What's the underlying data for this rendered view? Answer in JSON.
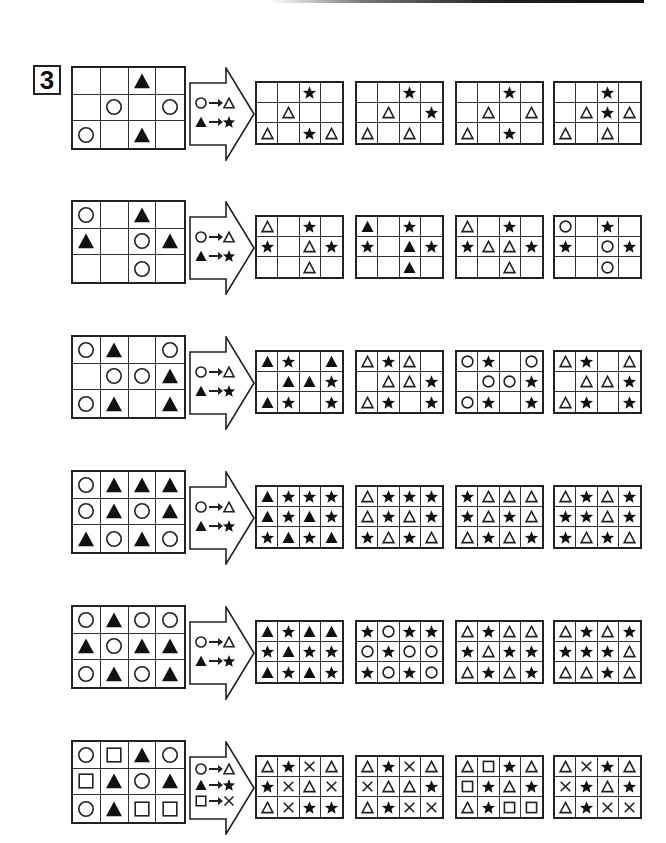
{
  "question_number": "3",
  "shape_key": {
    "circle": "outline circle",
    "tri_fill": "filled triangle",
    "tri_open": "outline triangle",
    "star": "filled star",
    "square": "outline square",
    "cross": "cross"
  },
  "rows": [
    {
      "source": [
        [
          "",
          "",
          "tri_fill",
          ""
        ],
        [
          "",
          "circle",
          "",
          "circle"
        ],
        [
          "circle",
          "",
          "tri_fill",
          ""
        ]
      ],
      "rules": [
        [
          "circle",
          "tri_open"
        ],
        [
          "tri_fill",
          "star"
        ]
      ],
      "options": [
        [
          [
            "",
            "",
            "star",
            ""
          ],
          [
            "",
            "tri_open",
            "",
            ""
          ],
          [
            "tri_open",
            "",
            "star",
            "tri_open"
          ]
        ],
        [
          [
            "",
            "",
            "star",
            ""
          ],
          [
            "",
            "tri_open",
            "",
            "star"
          ],
          [
            "tri_open",
            "",
            "tri_open",
            ""
          ]
        ],
        [
          [
            "",
            "",
            "star",
            ""
          ],
          [
            "",
            "tri_open",
            "",
            "tri_open"
          ],
          [
            "tri_open",
            "",
            "star",
            ""
          ]
        ],
        [
          [
            "",
            "",
            "star",
            ""
          ],
          [
            "",
            "tri_open",
            "star",
            "tri_open"
          ],
          [
            "tri_open",
            "",
            "tri_open",
            ""
          ]
        ]
      ]
    },
    {
      "source": [
        [
          "circle",
          "",
          "tri_fill",
          ""
        ],
        [
          "tri_fill",
          "",
          "circle",
          "tri_fill"
        ],
        [
          "",
          "",
          "circle",
          ""
        ]
      ],
      "rules": [
        [
          "circle",
          "tri_open"
        ],
        [
          "tri_fill",
          "star"
        ]
      ],
      "options": [
        [
          [
            "tri_open",
            "",
            "star",
            ""
          ],
          [
            "star",
            "",
            "tri_open",
            "star"
          ],
          [
            "",
            "",
            "tri_open",
            ""
          ]
        ],
        [
          [
            "tri_fill",
            "",
            "star",
            ""
          ],
          [
            "star",
            "",
            "tri_fill",
            "star"
          ],
          [
            "",
            "",
            "tri_fill",
            ""
          ]
        ],
        [
          [
            "tri_open",
            "",
            "star",
            ""
          ],
          [
            "star",
            "tri_open",
            "tri_open",
            "star"
          ],
          [
            "",
            "",
            "tri_open",
            ""
          ]
        ],
        [
          [
            "circle",
            "",
            "star",
            ""
          ],
          [
            "star",
            "",
            "circle",
            "star"
          ],
          [
            "",
            "",
            "circle",
            ""
          ]
        ]
      ]
    },
    {
      "source": [
        [
          "circle",
          "tri_fill",
          "",
          "circle"
        ],
        [
          "",
          "circle",
          "circle",
          "tri_fill"
        ],
        [
          "circle",
          "tri_fill",
          "",
          "tri_fill"
        ]
      ],
      "rules": [
        [
          "circle",
          "tri_open"
        ],
        [
          "tri_fill",
          "star"
        ]
      ],
      "options": [
        [
          [
            "tri_fill",
            "star",
            "",
            "tri_fill"
          ],
          [
            "",
            "tri_fill",
            "tri_fill",
            "star"
          ],
          [
            "tri_fill",
            "star",
            "",
            "star"
          ]
        ],
        [
          [
            "tri_open",
            "star",
            "tri_open",
            ""
          ],
          [
            "",
            "tri_open",
            "tri_open",
            "star"
          ],
          [
            "tri_open",
            "star",
            "",
            "star"
          ]
        ],
        [
          [
            "circle",
            "star",
            "",
            "circle"
          ],
          [
            "",
            "circle",
            "circle",
            "star"
          ],
          [
            "circle",
            "star",
            "",
            "star"
          ]
        ],
        [
          [
            "tri_open",
            "star",
            "",
            "tri_open"
          ],
          [
            "",
            "tri_open",
            "tri_open",
            "star"
          ],
          [
            "tri_open",
            "star",
            "",
            "star"
          ]
        ]
      ]
    },
    {
      "source": [
        [
          "circle",
          "tri_fill",
          "tri_fill",
          "tri_fill"
        ],
        [
          "circle",
          "tri_fill",
          "circle",
          "tri_fill"
        ],
        [
          "tri_fill",
          "circle",
          "tri_fill",
          "circle"
        ]
      ],
      "rules": [
        [
          "circle",
          "tri_open"
        ],
        [
          "tri_fill",
          "star"
        ]
      ],
      "options": [
        [
          [
            "tri_fill",
            "star",
            "star",
            "star"
          ],
          [
            "tri_fill",
            "star",
            "tri_fill",
            "star"
          ],
          [
            "star",
            "tri_fill",
            "star",
            "tri_fill"
          ]
        ],
        [
          [
            "tri_open",
            "star",
            "star",
            "star"
          ],
          [
            "tri_open",
            "star",
            "tri_open",
            "star"
          ],
          [
            "star",
            "tri_open",
            "star",
            "tri_open"
          ]
        ],
        [
          [
            "star",
            "tri_open",
            "tri_open",
            "tri_open"
          ],
          [
            "star",
            "tri_open",
            "star",
            "tri_open"
          ],
          [
            "tri_open",
            "star",
            "tri_open",
            "star"
          ]
        ],
        [
          [
            "tri_open",
            "star",
            "tri_open",
            "star"
          ],
          [
            "star",
            "star",
            "tri_open",
            "star"
          ],
          [
            "star",
            "tri_open",
            "star",
            "tri_open"
          ]
        ]
      ]
    },
    {
      "source": [
        [
          "circle",
          "tri_fill",
          "circle",
          "circle"
        ],
        [
          "tri_fill",
          "circle",
          "tri_fill",
          "tri_fill"
        ],
        [
          "circle",
          "tri_fill",
          "circle",
          "tri_fill"
        ]
      ],
      "rules": [
        [
          "circle",
          "tri_open"
        ],
        [
          "tri_fill",
          "star"
        ]
      ],
      "options": [
        [
          [
            "tri_fill",
            "star",
            "tri_fill",
            "tri_fill"
          ],
          [
            "star",
            "tri_fill",
            "star",
            "star"
          ],
          [
            "tri_fill",
            "star",
            "tri_fill",
            "star"
          ]
        ],
        [
          [
            "star",
            "circle",
            "star",
            "star"
          ],
          [
            "circle",
            "star",
            "circle",
            "circle"
          ],
          [
            "star",
            "circle",
            "star",
            "circle"
          ]
        ],
        [
          [
            "tri_open",
            "star",
            "tri_open",
            "tri_open"
          ],
          [
            "star",
            "tri_open",
            "star",
            "star"
          ],
          [
            "tri_open",
            "star",
            "tri_open",
            "star"
          ]
        ],
        [
          [
            "tri_open",
            "star",
            "tri_open",
            "star"
          ],
          [
            "star",
            "star",
            "star",
            "tri_open"
          ],
          [
            "tri_open",
            "tri_open",
            "star",
            "tri_open"
          ]
        ]
      ]
    },
    {
      "source": [
        [
          "circle",
          "square",
          "tri_fill",
          "circle"
        ],
        [
          "square",
          "tri_fill",
          "circle",
          "tri_fill"
        ],
        [
          "circle",
          "tri_fill",
          "square",
          "square"
        ]
      ],
      "rules": [
        [
          "circle",
          "tri_open"
        ],
        [
          "tri_fill",
          "star"
        ],
        [
          "square",
          "cross"
        ]
      ],
      "options": [
        [
          [
            "tri_open",
            "star",
            "cross",
            "tri_open"
          ],
          [
            "star",
            "cross",
            "tri_open",
            "cross"
          ],
          [
            "tri_open",
            "cross",
            "star",
            "star"
          ]
        ],
        [
          [
            "tri_open",
            "star",
            "cross",
            "tri_open"
          ],
          [
            "cross",
            "tri_open",
            "tri_open",
            "star"
          ],
          [
            "tri_open",
            "star",
            "cross",
            "cross"
          ]
        ],
        [
          [
            "tri_open",
            "square",
            "star",
            "tri_open"
          ],
          [
            "square",
            "star",
            "tri_open",
            "star"
          ],
          [
            "tri_open",
            "star",
            "square",
            "square"
          ]
        ],
        [
          [
            "tri_open",
            "cross",
            "star",
            "tri_open"
          ],
          [
            "cross",
            "star",
            "tri_open",
            "star"
          ],
          [
            "tri_open",
            "star",
            "cross",
            "cross"
          ]
        ]
      ]
    }
  ],
  "layout": {
    "row_tops": [
      66,
      200,
      335,
      470,
      605,
      740
    ],
    "option_lefts": [
      255,
      355,
      455,
      553
    ]
  }
}
